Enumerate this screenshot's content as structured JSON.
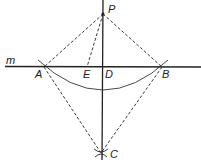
{
  "diagram": {
    "title": "",
    "line_label": "m",
    "points": {
      "P": {
        "label": "P",
        "x": 103,
        "y": 14
      },
      "A": {
        "label": "A",
        "x": 44,
        "y": 67
      },
      "E": {
        "label": "E",
        "x": 87,
        "y": 67
      },
      "D": {
        "label": "D",
        "x": 103,
        "y": 67
      },
      "B": {
        "label": "B",
        "x": 162,
        "y": 67
      },
      "C": {
        "label": "C",
        "x": 101,
        "y": 153
      }
    },
    "solid_lines": [
      "m (horizontal through A, E, D, B)",
      "PC (vertical through D)",
      "arc A–B centered at P"
    ],
    "dashed_lines": [
      "PA",
      "PB",
      "PE",
      "AC",
      "BC"
    ],
    "colors": {
      "stroke": "#222222",
      "background": "#ffffff"
    }
  }
}
